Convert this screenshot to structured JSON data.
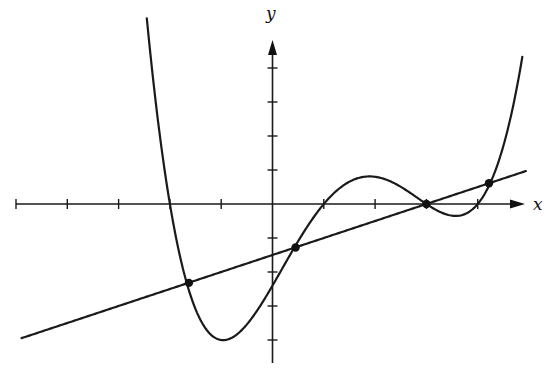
{
  "chart_data": {
    "type": "line",
    "title": "",
    "xlabel": "x",
    "ylabel": "y",
    "grid": false,
    "legend": null,
    "axes": {
      "x_ticks": [
        -5,
        -4,
        -3,
        -2,
        -1,
        1,
        2,
        3,
        4
      ],
      "y_ticks": [
        -4,
        -3,
        -2,
        -1,
        1,
        2,
        3,
        4
      ],
      "xlim": [
        -5.1,
        5.1
      ],
      "ylim": [
        -4.6,
        5.1
      ],
      "tick_labels_shown": false
    },
    "series": [
      {
        "name": "quartic curve",
        "kind": "function",
        "expression": "0.1*(x+2)*(x-1)*(x-3)*(x-4)",
        "roots": [
          -2,
          1,
          3,
          4
        ],
        "domain": [
          -2.45,
          4.87
        ]
      },
      {
        "name": "secant line",
        "kind": "function",
        "expression": "0.5*x - 1.5",
        "slope": 0.5,
        "intercept": -1.5,
        "domain": [
          -4.89,
          4.94
        ]
      }
    ],
    "intersection_points": [
      {
        "x": -1.63,
        "y": -2.32
      },
      {
        "x": 0.45,
        "y": -1.28
      },
      {
        "x": 3.0,
        "y": 0.0
      },
      {
        "x": 4.22,
        "y": 0.61
      }
    ]
  },
  "pixel_frame": {
    "origin_px": [
      272.5,
      204
    ],
    "x_unit_px": 51.3,
    "y_unit_px": 34,
    "x_axis_px": [
      16,
      525
    ],
    "y_axis_px": [
      40,
      363
    ]
  },
  "labels": {
    "x_axis": "x",
    "y_axis": "y"
  }
}
